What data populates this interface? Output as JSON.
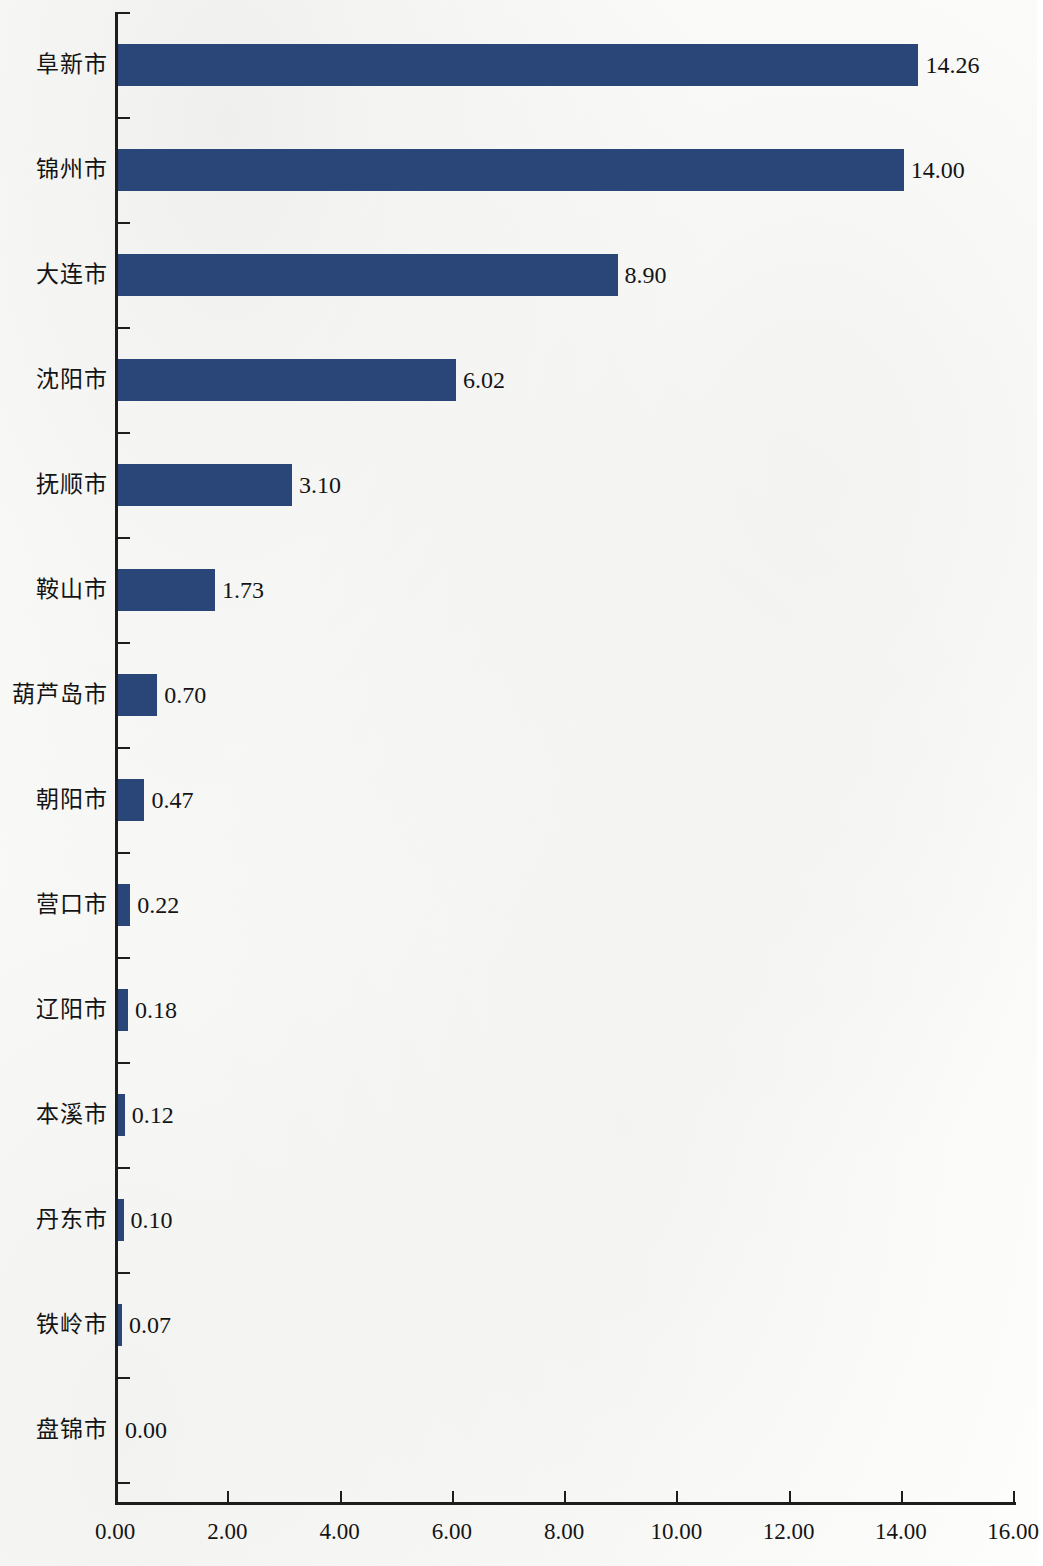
{
  "chart_data": {
    "type": "bar",
    "orientation": "horizontal",
    "title": "",
    "subtitle": "",
    "xlabel": "",
    "ylabel": "",
    "xlim": [
      0,
      16
    ],
    "xticks": [
      0,
      2,
      4,
      6,
      8,
      10,
      12,
      14,
      16
    ],
    "xtick_labels": [
      "0.00",
      "2.00",
      "4.00",
      "6.00",
      "8.00",
      "10.00",
      "12.00",
      "14.00",
      "16.00"
    ],
    "grid": false,
    "legend": null,
    "bar_color": "#2a4678",
    "axis_color": "#1d1d1d",
    "categories": [
      "阜新市",
      "锦州市",
      "大连市",
      "沈阳市",
      "抚顺市",
      "鞍山市",
      "葫芦岛市",
      "朝阳市",
      "营口市",
      "辽阳市",
      "本溪市",
      "丹东市",
      "铁岭市",
      "盘锦市"
    ],
    "values": [
      14.26,
      14.0,
      8.9,
      6.02,
      3.1,
      1.73,
      0.7,
      0.47,
      0.22,
      0.18,
      0.12,
      0.1,
      0.07,
      0.0
    ],
    "value_labels": [
      "14.26",
      "14.00",
      "8.90",
      "6.02",
      "3.10",
      "1.73",
      "0.70",
      "0.47",
      "0.22",
      "0.18",
      "0.12",
      "0.10",
      "0.07",
      "0.00"
    ]
  }
}
